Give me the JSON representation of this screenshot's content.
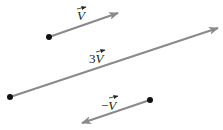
{
  "diagram": {
    "vectors": [
      {
        "id": "v",
        "label_prefix": "",
        "label_var": "V",
        "scalar": 1
      },
      {
        "id": "3v",
        "label_prefix": "3",
        "label_var": "V",
        "scalar": 3
      },
      {
        "id": "neg-v",
        "label_prefix": "−",
        "label_var": "V",
        "scalar": -1
      }
    ],
    "colors": {
      "arrow": "#8a8a8a",
      "point": "#111111",
      "text": "#222222"
    }
  }
}
